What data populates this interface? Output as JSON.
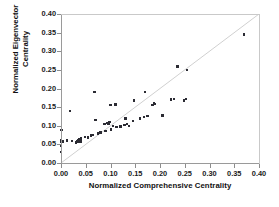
{
  "chart_data": {
    "type": "scatter",
    "title": "",
    "xlabel": "Normalized Comprehensive Centrality",
    "ylabel": "Normalized Eigenvector Centrality",
    "ylabel_line1": "Normalized Eigenvector",
    "ylabel_line2": "Centrality",
    "xlim": [
      0.0,
      0.4
    ],
    "ylim": [
      0.0,
      0.4
    ],
    "xticks": [
      "0.00",
      "0.05",
      "0.10",
      "0.15",
      "0.20",
      "0.25",
      "0.30",
      "0.35",
      "0.40"
    ],
    "yticks": [
      "0.00",
      "0.05",
      "0.10",
      "0.15",
      "0.20",
      "0.25",
      "0.30",
      "0.35",
      "0.40"
    ],
    "xtick_values": [
      0.0,
      0.05,
      0.1,
      0.15,
      0.2,
      0.25,
      0.3,
      0.35,
      0.4
    ],
    "ytick_values": [
      0.0,
      0.05,
      0.1,
      0.15,
      0.2,
      0.25,
      0.3,
      0.35,
      0.4
    ],
    "grid": false,
    "legend": null,
    "marker_color": "#2b2b33",
    "reference_line": {
      "type": "identity",
      "label": "y = x",
      "from": [
        0.0,
        0.0
      ],
      "to": [
        0.4,
        0.4
      ],
      "color": "#d0d0d0"
    },
    "points": [
      [
        0.0,
        0.029
      ],
      [
        0.0,
        0.046
      ],
      [
        0.0,
        0.056
      ],
      [
        0.0,
        0.06
      ],
      [
        0.001,
        0.089
      ],
      [
        0.003,
        0.058
      ],
      [
        0.012,
        0.06
      ],
      [
        0.018,
        0.14
      ],
      [
        0.022,
        0.059
      ],
      [
        0.03,
        0.055
      ],
      [
        0.033,
        0.058
      ],
      [
        0.035,
        0.061
      ],
      [
        0.037,
        0.063
      ],
      [
        0.039,
        0.058
      ],
      [
        0.04,
        0.066
      ],
      [
        0.048,
        0.07
      ],
      [
        0.055,
        0.069
      ],
      [
        0.06,
        0.074
      ],
      [
        0.065,
        0.076
      ],
      [
        0.068,
        0.19
      ],
      [
        0.07,
        0.115
      ],
      [
        0.075,
        0.079
      ],
      [
        0.08,
        0.082
      ],
      [
        0.088,
        0.105
      ],
      [
        0.09,
        0.086
      ],
      [
        0.094,
        0.108
      ],
      [
        0.096,
        0.104
      ],
      [
        0.098,
        0.11
      ],
      [
        0.1,
        0.155
      ],
      [
        0.101,
        0.09
      ],
      [
        0.105,
        0.1
      ],
      [
        0.11,
        0.157
      ],
      [
        0.112,
        0.096
      ],
      [
        0.12,
        0.098
      ],
      [
        0.128,
        0.102
      ],
      [
        0.13,
        0.12
      ],
      [
        0.133,
        0.104
      ],
      [
        0.137,
        0.1
      ],
      [
        0.145,
        0.113
      ],
      [
        0.148,
        0.168
      ],
      [
        0.16,
        0.12
      ],
      [
        0.168,
        0.124
      ],
      [
        0.17,
        0.19
      ],
      [
        0.175,
        0.126
      ],
      [
        0.185,
        0.155
      ],
      [
        0.188,
        0.16
      ],
      [
        0.19,
        0.158
      ],
      [
        0.205,
        0.128
      ],
      [
        0.222,
        0.17
      ],
      [
        0.228,
        0.172
      ],
      [
        0.235,
        0.259
      ],
      [
        0.248,
        0.168
      ],
      [
        0.252,
        0.172
      ],
      [
        0.255,
        0.249
      ],
      [
        0.37,
        0.345
      ]
    ]
  }
}
